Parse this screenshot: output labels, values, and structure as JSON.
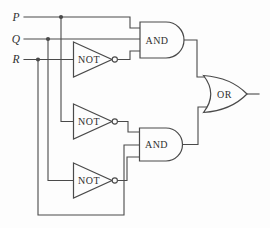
{
  "diagram": {
    "type": "logic-circuit",
    "inputs": {
      "p": "P",
      "q": "Q",
      "r": "R"
    },
    "gates": {
      "not1": "NOT",
      "not2": "NOT",
      "not3": "NOT",
      "and1": "AND",
      "and2": "AND",
      "or": "OR"
    },
    "connections": [
      "P -> AND1.in1",
      "Q -> AND1.in2",
      "R -> NOT1 -> AND1.in3",
      "P -> NOT2 -> AND2.in1",
      "R -> AND2.in2",
      "Q -> NOT3 -> AND2.in3",
      "AND1 -> OR.in1",
      "AND2 -> OR.in2",
      "OR -> output"
    ],
    "colors": {
      "line": "#4a4a4a",
      "text": "#2f2f2f",
      "background": "#fdfdfd"
    }
  }
}
